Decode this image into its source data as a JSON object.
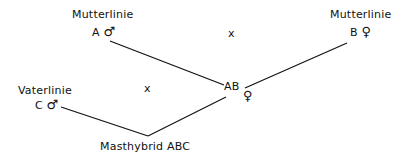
{
  "diagram": {
    "type": "breeding-cross",
    "nodes": {
      "line_a": {
        "title": "Mutterlinie",
        "letter": "A",
        "sex_symbol": "♂",
        "sex": "male"
      },
      "line_b": {
        "title": "Mutterlinie",
        "letter": "B",
        "sex_symbol": "♀",
        "sex": "female"
      },
      "line_c": {
        "title": "Vaterlinie",
        "letter": "C",
        "sex_symbol": "♂",
        "sex": "male"
      },
      "cross_ab": {
        "letter": "AB",
        "sex_symbol": "♀",
        "sex": "female"
      },
      "result": {
        "label": "Masthybrid ABC"
      }
    },
    "cross_marks": {
      "top": "x",
      "bottom": "x"
    },
    "edges": [
      {
        "from": "line_a",
        "to": "cross_ab"
      },
      {
        "from": "line_b",
        "to": "cross_ab"
      },
      {
        "from": "line_c",
        "to": "result"
      },
      {
        "from": "cross_ab",
        "to": "result"
      }
    ],
    "line_color": "#111111"
  }
}
